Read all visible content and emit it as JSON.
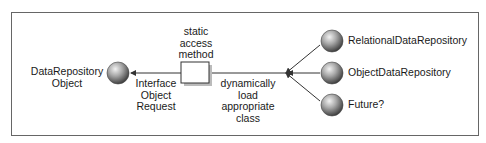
{
  "diagram": {
    "source_node": {
      "label_line1": "DataRepository",
      "label_line2": "Object"
    },
    "access_box": {
      "label_line1": "static",
      "label_line2": "access",
      "label_line3": "method"
    },
    "request_label": {
      "line1": "Interface",
      "line2": "Object",
      "line3": "Request"
    },
    "load_label": {
      "line1": "dynamically",
      "line2": "load",
      "line3": "appropriate",
      "line4": "class"
    },
    "targets": [
      {
        "label": "RelationalDataRepository"
      },
      {
        "label": "ObjectDataRepository"
      },
      {
        "label": "Future?"
      }
    ],
    "colors": {
      "border": "#666666",
      "line": "#333333",
      "sphere_light": "#e6e6e6",
      "sphere_dark": "#4a4a4a"
    }
  }
}
